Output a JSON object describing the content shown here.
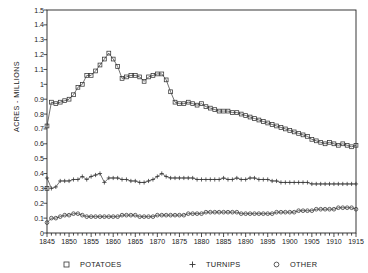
{
  "title_fragment": "",
  "axes": {
    "ylabel": "ACRES  -  MILLIONS",
    "ytick_labels": [
      "0",
      "0.1",
      "0.2",
      "0.3",
      "0.4",
      "0.5",
      "0.6",
      "0.7",
      "0.8",
      "0.9",
      "1",
      "1.1",
      "1.2",
      "1.3",
      "1.4",
      "1.5"
    ],
    "xtick_labels": [
      "1845",
      "1850",
      "1855",
      "1860",
      "1865",
      "1870",
      "1875",
      "1880",
      "1885",
      "1890",
      "1895",
      "1900",
      "1905",
      "1910",
      "1915"
    ]
  },
  "legend": {
    "position": "bottom",
    "items": [
      {
        "label": "POTATOES",
        "marker": "square-marker"
      },
      {
        "label": "TURNIPS",
        "marker": "plus-marker"
      },
      {
        "label": "OTHER",
        "marker": "circle-marker"
      }
    ]
  },
  "chart_data": {
    "type": "line",
    "title": "",
    "xlabel": "",
    "ylabel": "ACRES  -  MILLIONS",
    "xlim": [
      1845,
      1915
    ],
    "ylim": [
      0,
      1.5
    ],
    "grid": false,
    "legend_position": "bottom",
    "x": [
      1845,
      1846,
      1847,
      1848,
      1849,
      1850,
      1851,
      1852,
      1853,
      1854,
      1855,
      1856,
      1857,
      1858,
      1859,
      1860,
      1861,
      1862,
      1863,
      1864,
      1865,
      1866,
      1867,
      1868,
      1869,
      1870,
      1871,
      1872,
      1873,
      1874,
      1875,
      1876,
      1877,
      1878,
      1879,
      1880,
      1881,
      1882,
      1883,
      1884,
      1885,
      1886,
      1887,
      1888,
      1889,
      1890,
      1891,
      1892,
      1893,
      1894,
      1895,
      1896,
      1897,
      1898,
      1899,
      1900,
      1901,
      1902,
      1903,
      1904,
      1905,
      1906,
      1907,
      1908,
      1909,
      1910,
      1911,
      1912,
      1913,
      1914,
      1915
    ],
    "series": [
      {
        "name": "POTATOES",
        "marker": "square-marker",
        "values": [
          0.72,
          0.88,
          0.87,
          0.88,
          0.89,
          0.9,
          0.93,
          0.98,
          1.0,
          1.06,
          1.06,
          1.09,
          1.13,
          1.17,
          1.21,
          1.17,
          1.12,
          1.04,
          1.05,
          1.06,
          1.06,
          1.05,
          1.02,
          1.05,
          1.06,
          1.07,
          1.07,
          1.03,
          0.95,
          0.88,
          0.87,
          0.87,
          0.88,
          0.87,
          0.86,
          0.87,
          0.85,
          0.84,
          0.83,
          0.82,
          0.82,
          0.82,
          0.81,
          0.81,
          0.8,
          0.79,
          0.78,
          0.77,
          0.76,
          0.75,
          0.74,
          0.73,
          0.72,
          0.71,
          0.7,
          0.69,
          0.68,
          0.67,
          0.66,
          0.65,
          0.63,
          0.62,
          0.61,
          0.6,
          0.61,
          0.6,
          0.59,
          0.6,
          0.59,
          0.58,
          0.59
        ]
      },
      {
        "name": "TURNIPS",
        "marker": "plus-marker",
        "values": [
          0.37,
          0.3,
          0.31,
          0.35,
          0.35,
          0.35,
          0.36,
          0.36,
          0.38,
          0.36,
          0.38,
          0.39,
          0.4,
          0.34,
          0.37,
          0.37,
          0.37,
          0.36,
          0.36,
          0.35,
          0.35,
          0.34,
          0.34,
          0.35,
          0.36,
          0.38,
          0.4,
          0.38,
          0.37,
          0.37,
          0.37,
          0.37,
          0.37,
          0.37,
          0.36,
          0.36,
          0.36,
          0.36,
          0.36,
          0.36,
          0.37,
          0.36,
          0.36,
          0.37,
          0.36,
          0.36,
          0.37,
          0.37,
          0.36,
          0.36,
          0.36,
          0.35,
          0.35,
          0.34,
          0.34,
          0.34,
          0.34,
          0.34,
          0.34,
          0.34,
          0.33,
          0.33,
          0.33,
          0.33,
          0.33,
          0.33,
          0.33,
          0.33,
          0.33,
          0.33,
          0.33
        ]
      },
      {
        "name": "OTHER",
        "marker": "circle-marker",
        "values": [
          0.07,
          0.1,
          0.1,
          0.11,
          0.12,
          0.12,
          0.13,
          0.13,
          0.12,
          0.11,
          0.11,
          0.11,
          0.11,
          0.11,
          0.11,
          0.11,
          0.11,
          0.12,
          0.12,
          0.12,
          0.12,
          0.11,
          0.11,
          0.11,
          0.11,
          0.12,
          0.12,
          0.12,
          0.12,
          0.12,
          0.12,
          0.12,
          0.13,
          0.13,
          0.13,
          0.13,
          0.14,
          0.14,
          0.14,
          0.14,
          0.14,
          0.14,
          0.14,
          0.14,
          0.13,
          0.13,
          0.13,
          0.13,
          0.13,
          0.13,
          0.13,
          0.13,
          0.14,
          0.14,
          0.14,
          0.14,
          0.14,
          0.15,
          0.15,
          0.15,
          0.15,
          0.16,
          0.16,
          0.16,
          0.16,
          0.16,
          0.17,
          0.17,
          0.17,
          0.17,
          0.16
        ]
      }
    ],
    "extra_points": [
      {
        "series": "POTATOES",
        "x": 1845,
        "y": 0.3,
        "note": "isolated-square-marker"
      }
    ]
  },
  "colors": {
    "axis": "#222222",
    "series_line": "#333333",
    "background": "#ffffff"
  }
}
